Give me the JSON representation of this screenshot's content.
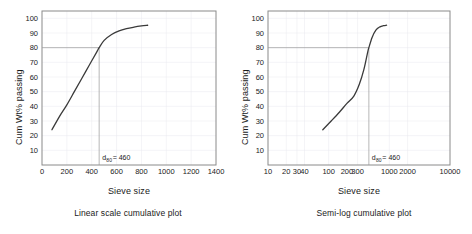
{
  "figure": {
    "background": "#ffffff",
    "axis_color": "#8a8a8a",
    "curve_color": "#3a3a3a",
    "grid_color": "#e8e8ee",
    "ref_line_color": "#9a9a9a"
  },
  "panels": [
    {
      "id": "linear",
      "caption": "Linear scale cumulative plot",
      "xlabel": "Sieve size",
      "ylabel": "Cum Wt% passing",
      "annotation": {
        "prefix": "d",
        "subscript": "80",
        "suffix": " = 460"
      }
    },
    {
      "id": "semilog",
      "caption": "Semi-log cumulative plot",
      "xlabel": "Sieve size",
      "ylabel": "Cum Wt% passing",
      "annotation": {
        "prefix": "d",
        "subscript": "80",
        "suffix": " = 460"
      }
    }
  ],
  "chart_data": [
    {
      "type": "line",
      "id": "linear-cumulative",
      "title": "Linear scale cumulative plot",
      "xlabel": "Sieve size",
      "ylabel": "Cum Wt% passing",
      "xscale": "linear",
      "yscale": "linear",
      "xlim": [
        0,
        1400
      ],
      "ylim": [
        0,
        105
      ],
      "xticks": [
        0,
        200,
        400,
        600,
        800,
        1000,
        1200,
        1400
      ],
      "xtick_labels": [
        "0",
        "200",
        "400",
        "600",
        "800",
        "1000",
        "1200",
        "1400"
      ],
      "yticks": [
        10,
        20,
        30,
        40,
        50,
        60,
        70,
        80,
        90,
        100
      ],
      "ytick_labels": [
        "10",
        "20",
        "30",
        "40",
        "50",
        "60",
        "70",
        "80",
        "90",
        "100"
      ],
      "grid": true,
      "legend": null,
      "series": [
        {
          "name": "Cumulative passing",
          "x": [
            80,
            140,
            200,
            260,
            320,
            380,
            440,
            460,
            500,
            560,
            620,
            680,
            740,
            800,
            850
          ],
          "values": [
            24,
            33,
            41,
            50,
            59,
            68,
            77,
            80,
            85,
            89,
            91.5,
            93,
            94,
            94.8,
            95.3
          ]
        }
      ],
      "annotations": [
        {
          "text": "d80 = 460",
          "x": 460,
          "y": 80,
          "reference_lines": {
            "horizontal_y": 80,
            "vertical_x": 460
          }
        }
      ]
    },
    {
      "type": "line",
      "id": "semilog-cumulative",
      "title": "Semi-log cumulative plot",
      "xlabel": "Sieve size",
      "ylabel": "Cum Wt% passing",
      "xscale": "log",
      "yscale": "linear",
      "xlim": [
        10,
        10000
      ],
      "ylim": [
        0,
        105
      ],
      "xticks": [
        10,
        20,
        30,
        40,
        100,
        200,
        300,
        1000,
        2000,
        10000
      ],
      "xtick_labels": [
        "10",
        "20",
        "30",
        "40",
        "100",
        "200",
        "300",
        "1000",
        "2000",
        "10000"
      ],
      "yticks": [
        10,
        20,
        30,
        40,
        50,
        60,
        70,
        80,
        90,
        100
      ],
      "ytick_labels": [
        "10",
        "20",
        "30",
        "40",
        "50",
        "60",
        "70",
        "80",
        "90",
        "100"
      ],
      "grid": true,
      "legend": null,
      "series": [
        {
          "name": "Cumulative passing",
          "x": [
            80,
            110,
            150,
            200,
            260,
            320,
            380,
            440,
            460,
            520,
            600,
            700,
            800,
            900
          ],
          "values": [
            24,
            30,
            36,
            42,
            47,
            55,
            65,
            77,
            80,
            87,
            92,
            94.2,
            95,
            95.3
          ]
        }
      ],
      "annotations": [
        {
          "text": "d80 = 460",
          "x": 460,
          "y": 80,
          "reference_lines": {
            "horizontal_y": 80,
            "vertical_x": 460
          }
        }
      ]
    }
  ]
}
